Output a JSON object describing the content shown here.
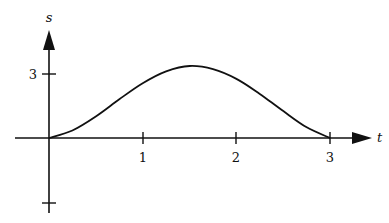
{
  "chart_data": {
    "type": "line",
    "title": "",
    "xlabel": "t",
    "ylabel": "s",
    "x_ticks": [
      "1",
      "2",
      "3"
    ],
    "y_ticks": [
      "3"
    ],
    "y_unlabeled_ticks": [
      -3
    ],
    "xlim": [
      -0.36,
      3.4
    ],
    "ylim": [
      -3.5,
      5
    ],
    "grid": false,
    "legend": "none",
    "series": [
      {
        "name": "s(t)",
        "x": [
          0,
          0.25,
          0.5,
          0.75,
          1.0,
          1.25,
          1.5,
          1.75,
          2.0,
          2.25,
          2.5,
          2.75,
          3.0
        ],
        "y": [
          0,
          0.35,
          1.0,
          1.8,
          2.55,
          3.1,
          3.35,
          3.2,
          2.75,
          2.05,
          1.25,
          0.5,
          0
        ]
      }
    ]
  },
  "axes": {
    "x_label": "t",
    "y_label": "s",
    "x_tick_labels": [
      "1",
      "2",
      "3"
    ],
    "y_tick_label": "3"
  }
}
